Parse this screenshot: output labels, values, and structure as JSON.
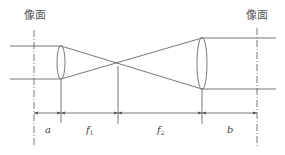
{
  "diagram": {
    "type": "optical-relay-lens-system",
    "labels": {
      "image_plane_left": "像面",
      "image_plane_right": "像面",
      "dim_a": "a",
      "dim_f1": "f",
      "dim_f1_sub": "1",
      "dim_f2": "f",
      "dim_f2_sub": "2",
      "dim_b": "b"
    },
    "elements": {
      "left_image_plane_x": 34,
      "left_lens_x": 61,
      "focal_point_x": 118,
      "right_lens_x": 202,
      "right_image_plane_x": 257
    },
    "colors": {
      "line": "#555555",
      "text": "#444444",
      "background": "#ffffff"
    }
  }
}
